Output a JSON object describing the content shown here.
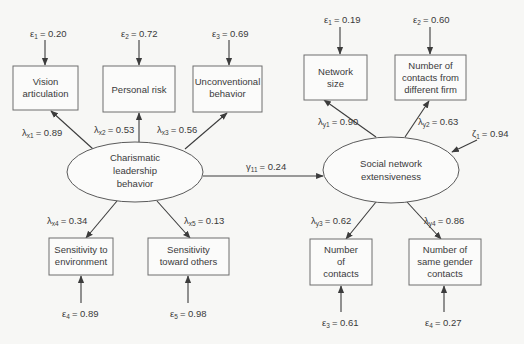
{
  "diagram": {
    "type": "structural-equation-path-diagram",
    "latent_variables": [
      {
        "id": "charismatic",
        "lines": [
          "Charismatic",
          "leadership",
          "behavior"
        ]
      },
      {
        "id": "social",
        "lines": [
          "Social network",
          "extensiveness"
        ]
      }
    ],
    "observed_variables": {
      "x1": {
        "lines": [
          "Vision",
          "articulation"
        ]
      },
      "x2": {
        "lines": [
          "Personal risk"
        ]
      },
      "x3": {
        "lines": [
          "Unconventional",
          "behavior"
        ]
      },
      "x4": {
        "lines": [
          "Sensitivity to",
          "environment"
        ]
      },
      "x5": {
        "lines": [
          "Sensitivity",
          "toward others"
        ]
      },
      "y1": {
        "lines": [
          "Network",
          "size"
        ]
      },
      "y2": {
        "lines": [
          "Number of",
          "contacts from",
          "different firm"
        ]
      },
      "y3": {
        "lines": [
          "Number",
          "of",
          "contacts"
        ]
      },
      "y4": {
        "lines": [
          "Number of",
          "same gender",
          "contacts"
        ]
      }
    },
    "errors": {
      "x1": {
        "symbol": "ε",
        "sub": "1",
        "value": "= 0.20"
      },
      "x2": {
        "symbol": "ε",
        "sub": "2",
        "value": "= 0.72"
      },
      "x3": {
        "symbol": "ε",
        "sub": "3",
        "value": "= 0.69"
      },
      "x4": {
        "symbol": "ε",
        "sub": "4",
        "value": "= 0.89"
      },
      "x5": {
        "symbol": "ε",
        "sub": "5",
        "value": "= 0.98"
      },
      "y1": {
        "symbol": "ε",
        "sub": "1",
        "value": "= 0.19"
      },
      "y2": {
        "symbol": "ε",
        "sub": "2",
        "value": "= 0.60"
      },
      "y3": {
        "symbol": "ε",
        "sub": "3",
        "value": "= 0.61"
      },
      "y4": {
        "symbol": "ε",
        "sub": "4",
        "value": "= 0.27"
      }
    },
    "loadings": {
      "x1": {
        "symbol": "λ",
        "sub": "x1",
        "value": "= 0.89"
      },
      "x2": {
        "symbol": "λ",
        "sub": "x2",
        "value": "= 0.53"
      },
      "x3": {
        "symbol": "λ",
        "sub": "x3",
        "value": "= 0.56"
      },
      "x4": {
        "symbol": "λ",
        "sub": "x4",
        "value": "= 0.34"
      },
      "x5": {
        "symbol": "λ",
        "sub": "x5",
        "value": "= 0.13"
      },
      "y1": {
        "symbol": "λ",
        "sub": "y1",
        "value": "= 0.90"
      },
      "y2": {
        "symbol": "λ",
        "sub": "y2",
        "value": "= 0.63"
      },
      "y3": {
        "symbol": "λ",
        "sub": "y3",
        "value": "= 0.62"
      },
      "y4": {
        "symbol": "λ",
        "sub": "y4",
        "value": "= 0.86"
      }
    },
    "structural_path": {
      "symbol": "γ",
      "sub": "11",
      "value": "= 0.24"
    },
    "disturbance": {
      "symbol": "ζ",
      "sub": "1",
      "value": "= 0.94"
    },
    "colors": {
      "line": "#3c3c3c",
      "text": "#3a3a3a",
      "background": "#f7f7f5"
    }
  }
}
